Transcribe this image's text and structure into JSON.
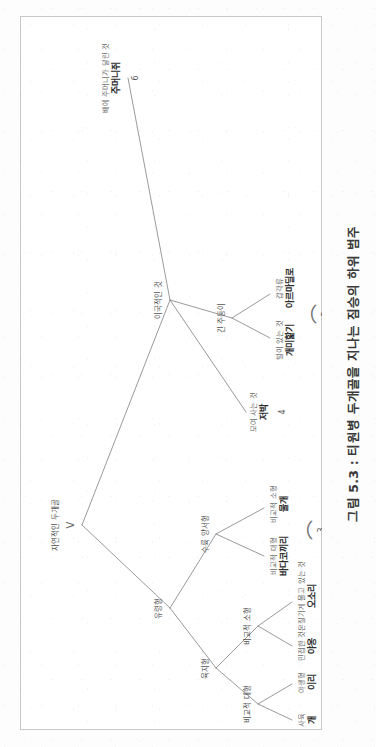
{
  "figure": {
    "caption": "그림 5.3 : 티원병 두개골을 지나는 짐승의 하위 범주",
    "root_marker": "V"
  },
  "nodes": {
    "root": {
      "label": "자연적인 두개골"
    },
    "ghost": {
      "label": "유령형"
    },
    "land": {
      "label": "육지형"
    },
    "amphibian": {
      "label": "수륙 양서형"
    },
    "exotic": {
      "label": "이국적인 것"
    },
    "long_snout": {
      "label": "긴 주둥이"
    },
    "large_land": {
      "label": "비교적 대형"
    },
    "small_land": {
      "label": "비교적 소형"
    }
  },
  "leaves": [
    {
      "id": "dog",
      "qualifier": "사육",
      "name": "개",
      "group": 1
    },
    {
      "id": "wolf",
      "qualifier": "야생형",
      "name": "이리",
      "group": 1
    },
    {
      "id": "cat",
      "qualifier": "민첩한 것",
      "name": "야옹",
      "group": 2
    },
    {
      "id": "mouse",
      "qualifier": "몬질기게 물고 있는 것",
      "name": "오소리",
      "group": 2
    },
    {
      "id": "seal",
      "qualifier": "비교적 대형",
      "name": "바다코끼리",
      "group": 3
    },
    {
      "id": "otter",
      "qualifier": "비교적 소형",
      "name": "물개",
      "group": 3
    },
    {
      "id": "bat",
      "qualifier": "모여 사는 것",
      "name": "저박",
      "group": 4
    },
    {
      "id": "anteater",
      "qualifier": "털이 있는 것",
      "name": "개미핥기",
      "group": 5
    },
    {
      "id": "armadillo",
      "qualifier": "갑각류",
      "name": "아르마딜로",
      "group": 5
    },
    {
      "id": "kangaroo",
      "qualifier": "배에 주머니가 달린 것",
      "name": "주머니쥐",
      "group": 6
    }
  ],
  "groups": [
    {
      "number": "1"
    },
    {
      "number": "2"
    },
    {
      "number": "3"
    },
    {
      "number": "4"
    },
    {
      "number": "5"
    },
    {
      "number": "6"
    }
  ],
  "colors": {
    "paper": "#ffffff",
    "frame": "#c9c9c9",
    "edge": "#8f8f8f",
    "text": "#4a4a4a",
    "leaf_text": "#2e2e2e"
  }
}
